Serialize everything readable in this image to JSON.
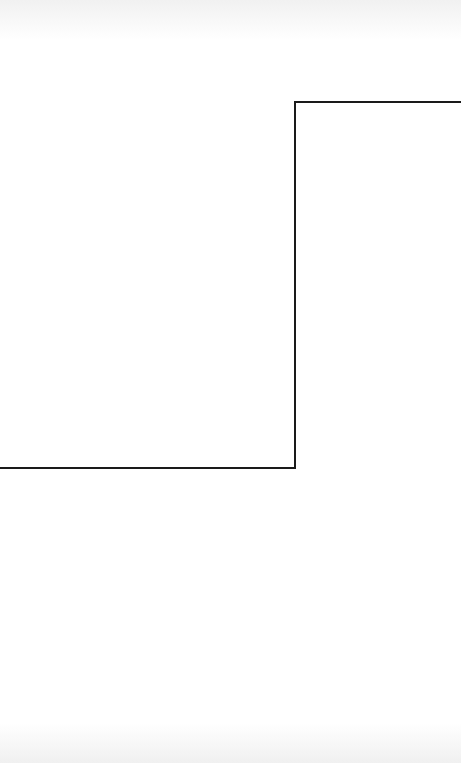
{
  "diagram": {
    "background": "#ffffff",
    "stroke_color": "#1a1a1a",
    "stroke_width": 2,
    "step_line": {
      "points": [
        [
          0,
          468
        ],
        [
          295,
          468
        ],
        [
          295,
          102
        ],
        [
          461,
          102
        ]
      ]
    }
  }
}
